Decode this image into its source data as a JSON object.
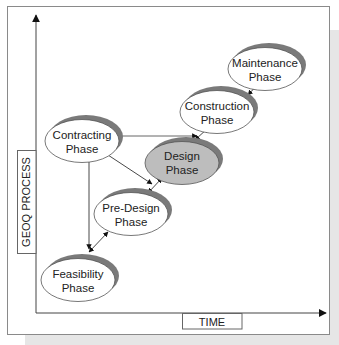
{
  "diagram": {
    "y_axis_label": "GEOQ PROCESS",
    "x_axis_label": "TIME",
    "highlight_fill": "#bdbdbd",
    "shadow_color": "#7a7a7a",
    "nodes": [
      {
        "id": "contracting",
        "line1": "Contracting",
        "line2": "Phase",
        "highlighted": false
      },
      {
        "id": "design",
        "line1": "Design",
        "line2": "Phase",
        "highlighted": true
      },
      {
        "id": "construction",
        "line1": "Construction",
        "line2": "Phase",
        "highlighted": false
      },
      {
        "id": "maintenance",
        "line1": "Maintenance",
        "line2": "Phase",
        "highlighted": false
      },
      {
        "id": "pre-design",
        "line1": "Pre-Design",
        "line2": "Phase",
        "highlighted": false
      },
      {
        "id": "feasibility",
        "line1": "Feasibility",
        "line2": "Phase",
        "highlighted": false
      }
    ],
    "edges": [
      {
        "from": "contracting",
        "to": "feasibility",
        "type": "one-way"
      },
      {
        "from": "contracting",
        "to": "design",
        "type": "one-way"
      },
      {
        "from": "contracting",
        "to": "construction",
        "type": "one-way"
      },
      {
        "from": "feasibility",
        "to": "pre-design",
        "type": "two-way"
      },
      {
        "from": "pre-design",
        "to": "design",
        "type": "two-way"
      },
      {
        "from": "design",
        "to": "construction",
        "type": "two-way"
      },
      {
        "from": "construction",
        "to": "maintenance",
        "type": "two-way"
      }
    ]
  }
}
